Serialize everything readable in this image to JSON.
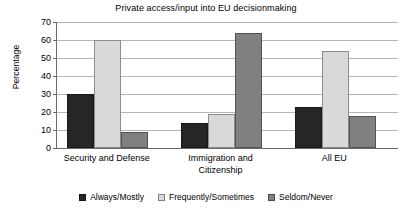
{
  "chart_data": {
    "type": "bar",
    "title": "Private access/input into EU decisionmaking",
    "xlabel": "",
    "ylabel": "Percentage",
    "ylim": [
      0,
      70
    ],
    "ytick_step": 10,
    "yticks": [
      0,
      10,
      20,
      30,
      40,
      50,
      60,
      70
    ],
    "ytick_labels": [
      "0",
      "10",
      "20",
      "30",
      "40",
      "50",
      "60",
      "70"
    ],
    "grid": true,
    "grid_axis": "y",
    "legend_position": "bottom",
    "categories": [
      "Security and Defense",
      "Immigration and\nCitizenship",
      "All EU"
    ],
    "series": [
      {
        "name": "Always/Mostly",
        "color": "#262626",
        "values": [
          30,
          14,
          23
        ]
      },
      {
        "name": "Frequently/Sometimes",
        "color": "#d9d9d9",
        "values": [
          60,
          19,
          54
        ]
      },
      {
        "name": "Seldom/Never",
        "color": "#808080",
        "values": [
          9,
          64,
          18
        ]
      }
    ]
  },
  "colors": {
    "background": "#ffffff",
    "axis": "#6b6b6b",
    "gridline": "#b4b4b4",
    "text": "#000000",
    "series_always_mostly": "#262626",
    "series_frequently_sometimes": "#d9d9d9",
    "series_seldom_never": "#808080"
  }
}
